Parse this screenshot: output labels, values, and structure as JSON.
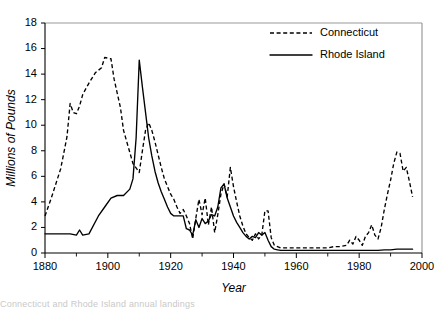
{
  "figure": {
    "background_color": "#ffffff",
    "ink_color": "#000000",
    "frame_color": "#9a9a9a",
    "caption_partial": "Connecticut and Rhode Island annual landings"
  },
  "chart_data": {
    "type": "line",
    "title": "",
    "subtitle": "",
    "xlabel": "Year",
    "ylabel": "Millions of Pounds",
    "xlim": [
      1880,
      2000
    ],
    "ylim": [
      0,
      18
    ],
    "xticks": [
      1880,
      1900,
      1920,
      1940,
      1960,
      1980,
      2000
    ],
    "xticklabels": [
      "1880",
      "1900",
      "1920",
      "1940",
      "1960",
      "1980",
      "2000"
    ],
    "xminorticks": [
      1890,
      1910,
      1930,
      1950,
      1970,
      1990
    ],
    "yticks": [
      0,
      2,
      4,
      6,
      8,
      10,
      12,
      14,
      16,
      18
    ],
    "yticklabels": [
      "0",
      "2",
      "4",
      "6",
      "8",
      "10",
      "12",
      "14",
      "16",
      "18"
    ],
    "grid": false,
    "legend_position": "top-right",
    "legend_entries": [
      "Connecticut",
      "Rhode Island"
    ],
    "series": [
      {
        "name": "Connecticut",
        "style": "dashed",
        "color": "#000000",
        "x": [
          1880,
          1882,
          1885,
          1887,
          1888,
          1889,
          1890,
          1891,
          1892,
          1894,
          1896,
          1897,
          1898,
          1899,
          1901,
          1902,
          1904,
          1905,
          1908,
          1910,
          1911,
          1912,
          1913,
          1914,
          1915,
          1916,
          1917,
          1918,
          1919,
          1920,
          1921,
          1922,
          1923,
          1924,
          1925,
          1926,
          1927,
          1928,
          1929,
          1930,
          1931,
          1932,
          1933,
          1934,
          1935,
          1936,
          1937,
          1938,
          1939,
          1940,
          1941,
          1942,
          1943,
          1944,
          1945,
          1946,
          1947,
          1948,
          1949,
          1950,
          1951,
          1952,
          1953,
          1954,
          1955,
          1956,
          1957,
          1958,
          1960,
          1962,
          1964,
          1966,
          1968,
          1970,
          1972,
          1974,
          1976,
          1977,
          1978,
          1979,
          1980,
          1981,
          1982,
          1983,
          1984,
          1985,
          1986,
          1987,
          1988,
          1989,
          1990,
          1991,
          1992,
          1993,
          1994,
          1995,
          1996,
          1997
        ],
        "y": [
          2.9,
          4.3,
          6.6,
          9.1,
          11.7,
          11.0,
          10.9,
          11.5,
          12.4,
          13.3,
          14.1,
          14.3,
          14.5,
          15.3,
          15.2,
          13.6,
          11.4,
          9.6,
          7.0,
          6.3,
          8.0,
          9.6,
          10.2,
          9.6,
          8.7,
          7.7,
          6.7,
          5.8,
          5.2,
          4.6,
          4.2,
          3.6,
          3.1,
          3.4,
          2.9,
          2.3,
          1.1,
          2.7,
          4.2,
          3.0,
          4.3,
          2.2,
          3.6,
          1.6,
          3.0,
          4.6,
          5.4,
          4.4,
          6.7,
          5.2,
          4.0,
          2.9,
          2.1,
          1.5,
          1.2,
          1.0,
          1.5,
          1.1,
          1.4,
          3.3,
          3.3,
          1.2,
          0.6,
          0.5,
          0.4,
          0.4,
          0.4,
          0.4,
          0.4,
          0.4,
          0.4,
          0.4,
          0.4,
          0.4,
          0.5,
          0.5,
          0.6,
          1.0,
          0.7,
          1.3,
          1.0,
          0.6,
          1.3,
          1.6,
          2.2,
          1.4,
          1.1,
          2.0,
          3.4,
          4.6,
          5.7,
          7.0,
          7.9,
          7.8,
          6.4,
          6.7,
          5.6,
          4.4
        ]
      },
      {
        "name": "Rhode Island",
        "style": "solid",
        "color": "#000000",
        "x": [
          1880,
          1885,
          1888,
          1890,
          1891,
          1892,
          1894,
          1897,
          1899,
          1901,
          1903,
          1905,
          1907,
          1908,
          1909,
          1910,
          1911,
          1912,
          1913,
          1914,
          1915,
          1916,
          1917,
          1918,
          1919,
          1920,
          1921,
          1922,
          1923,
          1924,
          1925,
          1926,
          1927,
          1928,
          1929,
          1930,
          1931,
          1932,
          1933,
          1934,
          1935,
          1936,
          1937,
          1938,
          1939,
          1940,
          1941,
          1942,
          1943,
          1944,
          1945,
          1946,
          1947,
          1948,
          1949,
          1950,
          1951,
          1952,
          1953,
          1954,
          1955,
          1956,
          1958,
          1960,
          1962,
          1964,
          1966,
          1968,
          1970,
          1972,
          1974,
          1976,
          1978,
          1980,
          1982,
          1984,
          1986,
          1988,
          1990,
          1992,
          1994,
          1996,
          1997
        ],
        "y": [
          1.5,
          1.5,
          1.5,
          1.4,
          1.8,
          1.4,
          1.5,
          2.9,
          3.6,
          4.3,
          4.5,
          4.5,
          5.0,
          5.8,
          9.0,
          15.1,
          13.0,
          11.0,
          9.0,
          7.6,
          6.4,
          5.5,
          4.8,
          4.2,
          3.6,
          3.1,
          2.9,
          2.9,
          2.9,
          2.9,
          1.9,
          1.8,
          1.4,
          2.6,
          2.0,
          2.7,
          2.3,
          2.5,
          3.0,
          2.9,
          3.6,
          5.1,
          5.4,
          4.3,
          3.6,
          2.9,
          2.4,
          2.0,
          1.6,
          1.3,
          1.1,
          1.3,
          1.2,
          1.6,
          1.4,
          1.6,
          1.0,
          0.5,
          0.3,
          0.25,
          0.2,
          0.2,
          0.2,
          0.2,
          0.2,
          0.2,
          0.2,
          0.2,
          0.2,
          0.2,
          0.2,
          0.2,
          0.2,
          0.2,
          0.2,
          0.2,
          0.2,
          0.25,
          0.25,
          0.3,
          0.3,
          0.3,
          0.3
        ]
      }
    ]
  },
  "plot_geometry": {
    "left": 45,
    "right": 422,
    "top": 23,
    "bottom": 253
  },
  "legend_geometry": {
    "sample_x1": 270,
    "sample_x2": 312,
    "label_x": 320,
    "row1_y": 33,
    "row2_y": 55
  }
}
